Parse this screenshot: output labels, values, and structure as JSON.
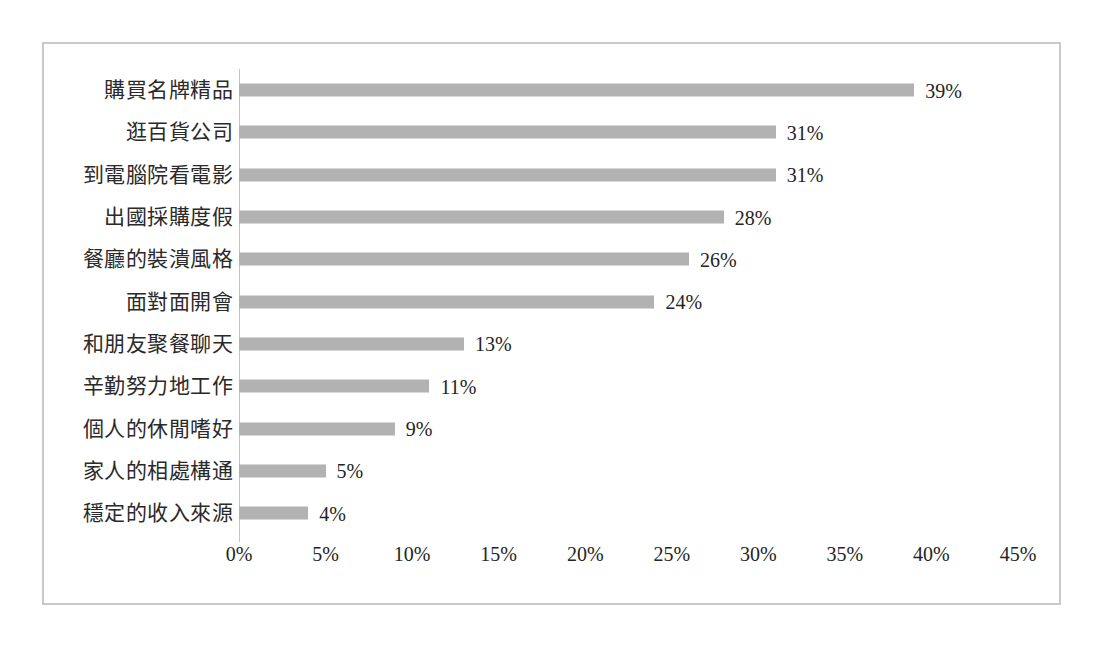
{
  "chart_data": {
    "type": "bar",
    "orientation": "horizontal",
    "title": "",
    "subtitle": "",
    "xlabel": "",
    "ylabel": "",
    "xlim": [
      0,
      45
    ],
    "xtick_step": 5,
    "grid": false,
    "legend": false,
    "value_suffix": "%",
    "bar_color": "#b2b2b2",
    "axis_color": "#c4c4c4",
    "frame_color": "#c9c9c9",
    "text_color": "#242424",
    "xticks": [
      "0%",
      "5%",
      "10%",
      "15%",
      "20%",
      "25%",
      "30%",
      "35%",
      "40%",
      "45%"
    ],
    "categories": [
      "購買名牌精品",
      "逛百貨公司",
      "到電腦院看電影",
      "出國採購度假",
      "餐廳的裝潰風格",
      "面對面開會",
      "和朋友聚餐聊天",
      "辛勤努力地工作",
      "個人的休閒嗜好",
      "家人的相處構通",
      "穩定的收入來源"
    ],
    "values": [
      39,
      31,
      31,
      28,
      26,
      24,
      13,
      11,
      9,
      5,
      4
    ],
    "data_labels": [
      "39%",
      "31%",
      "31%",
      "28%",
      "26%",
      "24%",
      "13%",
      "11%",
      "9%",
      "5%",
      "4%"
    ]
  }
}
